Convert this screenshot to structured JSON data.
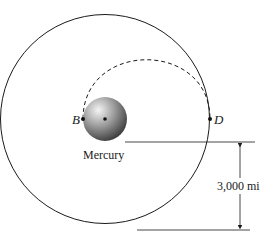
{
  "diagram": {
    "planet_label": "Mercury",
    "point_b": "B",
    "point_d": "D",
    "dimension_label": "3,000 mi",
    "colors": {
      "line": "#1a1a1a",
      "planet_light": "#f2f2f2",
      "planet_dark": "#3a3a3a"
    }
  }
}
